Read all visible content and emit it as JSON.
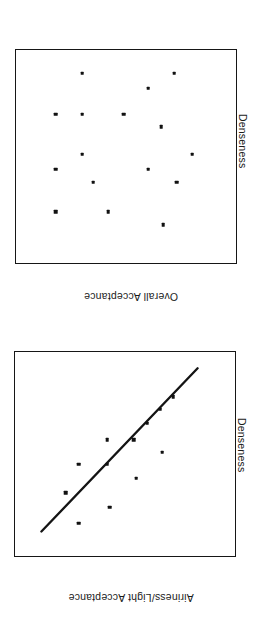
{
  "figure": {
    "orientation": "rotated-180",
    "background": "#ffffff",
    "ink_color": "#141414",
    "panels": [
      "airiness_light_acceptance",
      "overall_acceptance"
    ]
  },
  "chart_data": [
    {
      "type": "scatter",
      "id": "airiness_light_acceptance",
      "title": "",
      "xlabel": "Airiness/Light  Acceptance",
      "ylabel": "Denseness",
      "xlim": [
        0,
        100
      ],
      "ylim": [
        0,
        100
      ],
      "grid": false,
      "legend": null,
      "axis_ticks": [],
      "trendline": {
        "present": true,
        "x": [
          17,
          88
        ],
        "y": [
          8,
          88
        ],
        "style": "solid"
      },
      "points": [
        {
          "x": 71,
          "y": 84
        },
        {
          "x": 57,
          "y": 76
        },
        {
          "x": 45,
          "y": 62
        },
        {
          "x": 77,
          "y": 69
        },
        {
          "x": 58,
          "y": 55
        },
        {
          "x": 71,
          "y": 55
        },
        {
          "x": 33,
          "y": 49
        },
        {
          "x": 46,
          "y": 43
        },
        {
          "x": 58,
          "y": 43
        },
        {
          "x": 40,
          "y": 35
        },
        {
          "x": 28,
          "y": 22
        },
        {
          "x": 34,
          "y": 28
        }
      ]
    },
    {
      "type": "scatter",
      "id": "overall_acceptance",
      "title": "",
      "xlabel": "Overall  Acceptance",
      "ylabel": "Denseness",
      "xlim": [
        0,
        100
      ],
      "ylim": [
        0,
        100
      ],
      "grid": false,
      "legend": null,
      "axis_ticks": [],
      "trendline": {
        "present": false
      },
      "points": [
        {
          "x": 33,
          "y": 82
        },
        {
          "x": 58,
          "y": 76
        },
        {
          "x": 82,
          "y": 76
        },
        {
          "x": 27,
          "y": 62
        },
        {
          "x": 65,
          "y": 62
        },
        {
          "x": 40,
          "y": 56
        },
        {
          "x": 82,
          "y": 56
        },
        {
          "x": 20,
          "y": 49
        },
        {
          "x": 70,
          "y": 49
        },
        {
          "x": 34,
          "y": 36
        },
        {
          "x": 51,
          "y": 30
        },
        {
          "x": 70,
          "y": 30
        },
        {
          "x": 82,
          "y": 30
        },
        {
          "x": 40,
          "y": 18
        },
        {
          "x": 70,
          "y": 11
        },
        {
          "x": 28,
          "y": 11
        }
      ]
    }
  ]
}
